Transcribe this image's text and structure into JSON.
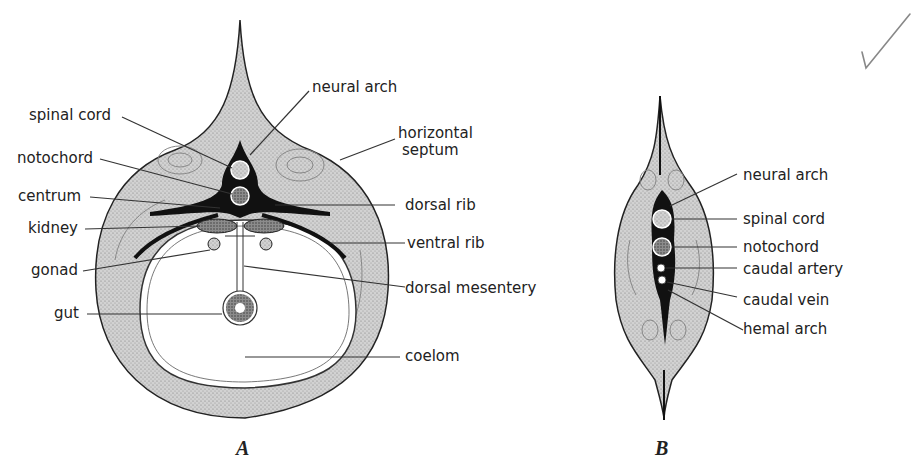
{
  "figure_a": {
    "caption": "A",
    "labels": {
      "spinal_cord": "spinal cord",
      "notochord": "notochord",
      "centrum": "centrum",
      "kidney": "kidney",
      "gonad": "gonad",
      "gut": "gut",
      "neural_arch": "neural arch",
      "horizontal_septum_1": "horizontal",
      "horizontal_septum_2": "septum",
      "dorsal_rib": "dorsal rib",
      "ventral_rib": "ventral rib",
      "dorsal_mesentery": "dorsal mesentery",
      "coelom": "coelom"
    }
  },
  "figure_b": {
    "caption": "B",
    "labels": {
      "neural_arch": "neural arch",
      "spinal_cord": "spinal cord",
      "notochord": "notochord",
      "caudal_artery": "caudal artery",
      "caudal_vein": "caudal vein",
      "hemal_arch": "hemal arch"
    }
  },
  "colors": {
    "tissue": "#c9c9c9",
    "ink": "#111111",
    "line": "#333333"
  }
}
